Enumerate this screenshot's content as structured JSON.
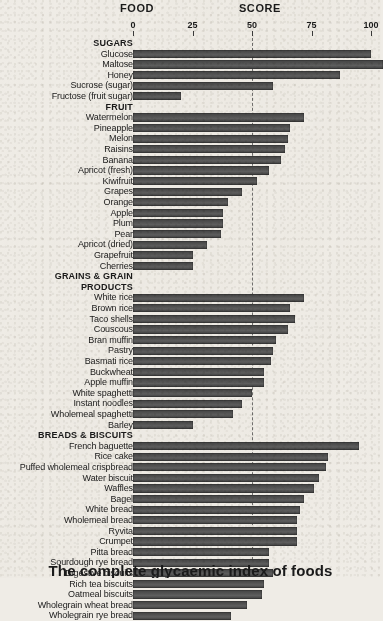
{
  "header": {
    "food_label": "FOOD",
    "score_label": "SCORE"
  },
  "caption": "The complete glycaemic index of foods",
  "colors": {
    "bar": "#4c4c4c",
    "background": "#efece6",
    "text": "#1a1a1a",
    "midline": "#5a5a5a"
  },
  "chart_data": {
    "type": "bar",
    "orientation": "horizontal",
    "title": "The complete glycaemic index of foods",
    "xlabel": "SCORE",
    "ylabel": "FOOD",
    "xlim": [
      0,
      100
    ],
    "ticks": [
      0,
      25,
      50,
      75,
      100
    ],
    "grid": false,
    "reference_line": 50,
    "sections": [
      {
        "name": "SUGARS",
        "items": [
          {
            "label": "Glucose",
            "value": 100
          },
          {
            "label": "Maltose",
            "value": 105
          },
          {
            "label": "Honey",
            "value": 87
          },
          {
            "label": "Sucrose (sugar)",
            "value": 59
          },
          {
            "label": "Fructose (fruit sugar)",
            "value": 20
          }
        ]
      },
      {
        "name": "FRUIT",
        "items": [
          {
            "label": "Watermelon",
            "value": 72
          },
          {
            "label": "Pineapple",
            "value": 66
          },
          {
            "label": "Melon",
            "value": 65
          },
          {
            "label": "Raisins",
            "value": 64
          },
          {
            "label": "Banana",
            "value": 62
          },
          {
            "label": "Apricot (fresh)",
            "value": 57
          },
          {
            "label": "Kiwifruit",
            "value": 52
          },
          {
            "label": "Grapes",
            "value": 46
          },
          {
            "label": "Orange",
            "value": 40
          },
          {
            "label": "Apple",
            "value": 38
          },
          {
            "label": "Plum",
            "value": 38
          },
          {
            "label": "Pear",
            "value": 37
          },
          {
            "label": "Apricot (dried)",
            "value": 31
          },
          {
            "label": "Grapefruit",
            "value": 25
          },
          {
            "label": "Cherries",
            "value": 25
          }
        ]
      },
      {
        "name": "GRAINS & GRAIN PRODUCTS",
        "name_line1": "GRAINS & GRAIN",
        "name_line2": "PRODUCTS",
        "items": [
          {
            "label": "White rice",
            "value": 72
          },
          {
            "label": "Brown rice",
            "value": 66
          },
          {
            "label": "Taco shells",
            "value": 68
          },
          {
            "label": "Couscous",
            "value": 65
          },
          {
            "label": "Bran muffin",
            "value": 60
          },
          {
            "label": "Pastry",
            "value": 59
          },
          {
            "label": "Basmati rice",
            "value": 58
          },
          {
            "label": "Buckwheat",
            "value": 55
          },
          {
            "label": "Apple muffin",
            "value": 55
          },
          {
            "label": "White spaghetti",
            "value": 50
          },
          {
            "label": "Instant noodles",
            "value": 46
          },
          {
            "label": "Wholemeal spaghetti",
            "value": 42
          },
          {
            "label": "Barley",
            "value": 25
          }
        ]
      },
      {
        "name": "BREADS & BISCUITS",
        "items": [
          {
            "label": "French baguette",
            "value": 95
          },
          {
            "label": "Rice cake",
            "value": 82
          },
          {
            "label": "Puffed wholemeal crispbread",
            "value": 81
          },
          {
            "label": "Water biscuit",
            "value": 78
          },
          {
            "label": "Waffles",
            "value": 76
          },
          {
            "label": "Bagel",
            "value": 72
          },
          {
            "label": "White bread",
            "value": 70
          },
          {
            "label": "Wholemeal bread",
            "value": 69
          },
          {
            "label": "Ryvita",
            "value": 69
          },
          {
            "label": "Crumpet",
            "value": 69
          },
          {
            "label": "Pitta bread",
            "value": 57
          },
          {
            "label": "Sourdough rye bread",
            "value": 57
          },
          {
            "label": "Digestive biscuits",
            "value": 59
          },
          {
            "label": "Rich tea biscuits",
            "value": 55
          },
          {
            "label": "Oatmeal biscuits",
            "value": 54
          },
          {
            "label": "Wholegrain wheat bread",
            "value": 48
          },
          {
            "label": "Wholegrain rye bread",
            "value": 41
          }
        ]
      }
    ]
  }
}
